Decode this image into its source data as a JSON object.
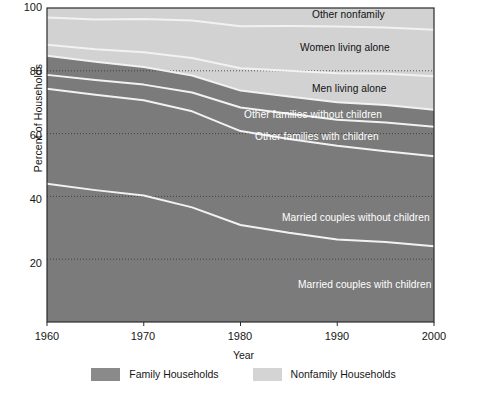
{
  "chart_data": {
    "type": "area",
    "title": "",
    "xlabel": "Year",
    "ylabel": "Percent of Households",
    "xlim": [
      1960,
      2000
    ],
    "ylim": [
      0,
      100
    ],
    "grid": true,
    "grid_lines_y": [
      20,
      40,
      60,
      80
    ],
    "stacked": true,
    "legend_position": "bottom",
    "x": [
      1960,
      1965,
      1970,
      1975,
      1980,
      1985,
      1990,
      1995,
      2000
    ],
    "xticks": [
      1960,
      1970,
      1980,
      1990,
      2000
    ],
    "yticks": [
      20,
      40,
      60,
      80,
      100
    ],
    "series": [
      {
        "name": "Married couples with children",
        "group": "Family Households",
        "color": "#7b7b7b",
        "values": [
          44.0,
          42.0,
          40.3,
          36.5,
          30.9,
          28.4,
          26.3,
          25.5,
          24.1
        ]
      },
      {
        "name": "Married couples without children",
        "group": "Family Households",
        "color": "#7b7b7b",
        "values": [
          30.3,
          30.4,
          30.3,
          30.6,
          29.9,
          29.9,
          29.8,
          28.9,
          28.7
        ]
      },
      {
        "name": "Other families with children",
        "group": "Family Households",
        "color": "#7b7b7b",
        "values": [
          4.4,
          4.7,
          5.0,
          6.0,
          7.5,
          8.0,
          8.3,
          9.1,
          9.4
        ]
      },
      {
        "name": "Other families without children",
        "group": "Family Households",
        "color": "#7b7b7b",
        "values": [
          6.1,
          5.8,
          5.6,
          5.4,
          5.4,
          5.5,
          5.6,
          5.6,
          5.4
        ]
      },
      {
        "name": "Men living alone",
        "group": "Nonfamily Households",
        "color": "#d2d2d2",
        "values": [
          3.5,
          4.0,
          4.7,
          5.6,
          7.1,
          8.2,
          9.2,
          10.0,
          10.7
        ]
      },
      {
        "name": "Women living alone",
        "group": "Nonfamily Households",
        "color": "#d2d2d2",
        "values": [
          8.7,
          9.4,
          10.6,
          11.9,
          13.4,
          14.3,
          14.9,
          14.7,
          14.8
        ]
      },
      {
        "name": "Other nonfamily",
        "group": "Nonfamily Households",
        "color": "#d2d2d2",
        "values": [
          3.0,
          3.7,
          3.5,
          4.0,
          5.8,
          5.7,
          5.9,
          6.2,
          6.9
        ]
      }
    ]
  },
  "axes": {
    "ylabel": "Percent of Households",
    "xlabel": "Year",
    "yticks": [
      "20",
      "40",
      "60",
      "80",
      "100"
    ],
    "xticks": [
      "1960",
      "1970",
      "1980",
      "1990",
      "2000"
    ]
  },
  "band_labels": [
    {
      "text": "Other nonfamily",
      "tone": "dark"
    },
    {
      "text": "Women living alone",
      "tone": "dark"
    },
    {
      "text": "Men living alone",
      "tone": "dark"
    },
    {
      "text": "Other families without children",
      "tone": "light"
    },
    {
      "text": "Other families with children",
      "tone": "light"
    },
    {
      "text": "Married couples without children",
      "tone": "light"
    },
    {
      "text": "Married couples with children",
      "tone": "light"
    }
  ],
  "legend": {
    "items": [
      {
        "label": "Family Households",
        "color": "#8a8a8a"
      },
      {
        "label": "Nonfamily Households",
        "color": "#d4d4d4"
      }
    ]
  },
  "colors": {
    "family": "#7b7b7b",
    "nonfamily": "#d2d2d2",
    "separator": "#f2f2f2",
    "axis": "#2a2a2a",
    "grid": "#3a3a3a"
  }
}
